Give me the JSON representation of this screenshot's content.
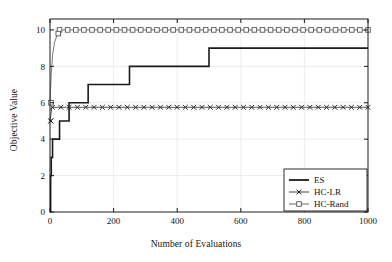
{
  "chart_data": {
    "type": "line",
    "title": "",
    "xlabel": "Number of Evaluations",
    "ylabel": "Objective Value",
    "xlim": [
      0,
      1000
    ],
    "ylim": [
      0,
      10.6
    ],
    "xticks": [
      0,
      200,
      400,
      600,
      800,
      1000
    ],
    "yticks": [
      0,
      2,
      4,
      6,
      8,
      10
    ],
    "xtick_labels": [
      "0",
      "200",
      "400",
      "600",
      "800",
      "1000"
    ],
    "ytick_labels": [
      "0",
      "2",
      "4",
      "6",
      "8",
      "10"
    ],
    "grid": true,
    "grid_color": "#e8e8e8",
    "legend_position": "lower right",
    "background": "#ffffff",
    "axis_color": "#1a1a1a",
    "series": [
      {
        "name": "ES",
        "style": "step",
        "marker": "none",
        "color": "#1a1a1a",
        "linewidth": 1.6,
        "points": [
          [
            0,
            0.0
          ],
          [
            2,
            2.0
          ],
          [
            4,
            3.0
          ],
          [
            8,
            4.0
          ],
          [
            30,
            5.0
          ],
          [
            60,
            6.0
          ],
          [
            120,
            7.0
          ],
          [
            250,
            8.0
          ],
          [
            500,
            9.0
          ],
          [
            1000,
            9.0
          ]
        ]
      },
      {
        "name": "HC-LR",
        "style": "line",
        "marker": "x",
        "color": "#2b2b2b",
        "linewidth": 0.8,
        "value": 5.75,
        "points": [
          [
            0,
            5.0
          ],
          [
            6,
            5.75
          ],
          [
            1000,
            5.75
          ]
        ]
      },
      {
        "name": "HC-Rand",
        "style": "line",
        "marker": "square",
        "color": "#555555",
        "linewidth": 0.8,
        "points": [
          [
            0,
            6.0
          ],
          [
            4,
            7.6
          ],
          [
            8,
            8.6
          ],
          [
            14,
            9.3
          ],
          [
            22,
            9.7
          ],
          [
            30,
            9.85
          ],
          [
            40,
            10.0
          ],
          [
            1000,
            10.0
          ]
        ]
      }
    ],
    "legend_entries": [
      {
        "label": "ES",
        "marker": "none",
        "color": "#1a1a1a"
      },
      {
        "label": "HC-LR",
        "marker": "x",
        "color": "#2b2b2b"
      },
      {
        "label": "HC-Rand",
        "marker": "square",
        "color": "#555555"
      }
    ]
  }
}
